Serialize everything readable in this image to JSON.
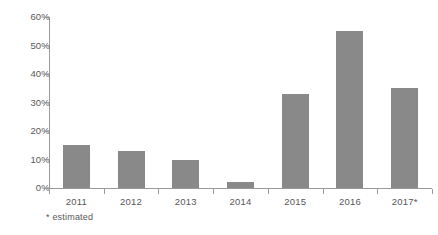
{
  "chart_data": {
    "type": "bar",
    "title": "",
    "subtitle": "",
    "xlabel": "",
    "ylabel": "",
    "categories": [
      "2011",
      "2012",
      "2013",
      "2014",
      "2015",
      "2016",
      "2017*"
    ],
    "values": [
      15,
      13,
      10,
      2,
      33,
      55,
      35
    ],
    "value_suffix": "%",
    "ylim": [
      0,
      60
    ],
    "ytick_values": [
      0,
      10,
      20,
      30,
      40,
      50,
      60
    ],
    "ytick_labels": [
      "0%",
      "10%",
      "20%",
      "30%",
      "40%",
      "50%",
      "60%"
    ],
    "grid": false,
    "legend": null,
    "annotations": [
      "* estimated"
    ],
    "series": [
      {
        "name": "",
        "values": [
          15,
          13,
          10,
          2,
          33,
          55,
          35
        ],
        "color": "#898989"
      }
    ]
  },
  "footnote": "* estimated",
  "colors": {
    "bar": "#898989",
    "axis": "#9b9b9d",
    "text": "#58585a",
    "background": "#ffffff"
  }
}
